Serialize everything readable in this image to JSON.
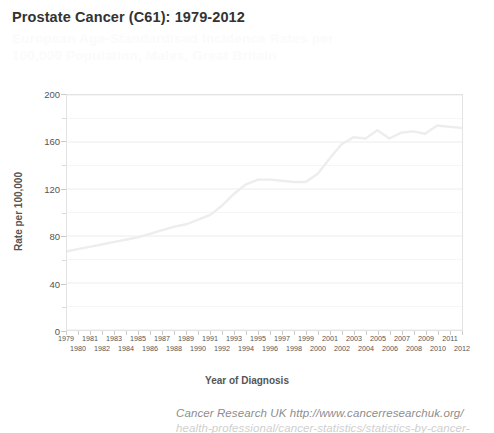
{
  "title": "Prostate Cancer (C61): 1979-2012",
  "subtitle": "European Age-Standardised Incidence Rates per 100,000 Population, Males, Great Britain",
  "footer": {
    "line1": "Cancer Research UK  http://www.cancerresearchuk.org/",
    "line2": "health-professional/cancer-statistics/statistics-by-cancer-type/"
  },
  "axes": {
    "y_title": "Rate per 100,000",
    "x_title": "Year of Diagnosis",
    "y_ticks": [
      "0",
      "40",
      "80",
      "120",
      "160",
      "200"
    ],
    "y_minor_ticks": [
      "20",
      "60",
      "100",
      "140",
      "180"
    ]
  },
  "colors": {
    "line": "#ededed",
    "grid": "#f1f1f1",
    "axis": "#e0e0e0",
    "title": "#333333",
    "label": "#555555",
    "footer": "#8d8d8d"
  },
  "chart_data": {
    "type": "line",
    "title": "Prostate Cancer (C61): 1979-2012",
    "subtitle": "European Age-Standardised Incidence Rates per 100,000 Population, Males, Great Britain",
    "xlabel": "Year of Diagnosis",
    "ylabel": "Rate per 100,000",
    "ylim": [
      0,
      200
    ],
    "ytick_interval": 40,
    "yminor_interval": 20,
    "grid": true,
    "legend": "none",
    "categories": [
      "1979",
      "1980",
      "1981",
      "1982",
      "1983",
      "1984",
      "1985",
      "1986",
      "1987",
      "1988",
      "1989",
      "1990",
      "1991",
      "1992",
      "1993",
      "1994",
      "1995",
      "1996",
      "1997",
      "1998",
      "1999",
      "2000",
      "2001",
      "2002",
      "2003",
      "2004",
      "2005",
      "2006",
      "2007",
      "2008",
      "2009",
      "2010",
      "2011",
      "2012"
    ],
    "series": [
      {
        "name": "European Age-Standardised Incidence Rate",
        "values": [
          67,
          69,
          71,
          73,
          75,
          77,
          79,
          82,
          85,
          88,
          90,
          94,
          98,
          106,
          116,
          124,
          128,
          128,
          127,
          126,
          126,
          133,
          146,
          158,
          164,
          163,
          170,
          163,
          168,
          169,
          167,
          174,
          173,
          172
        ]
      }
    ]
  }
}
